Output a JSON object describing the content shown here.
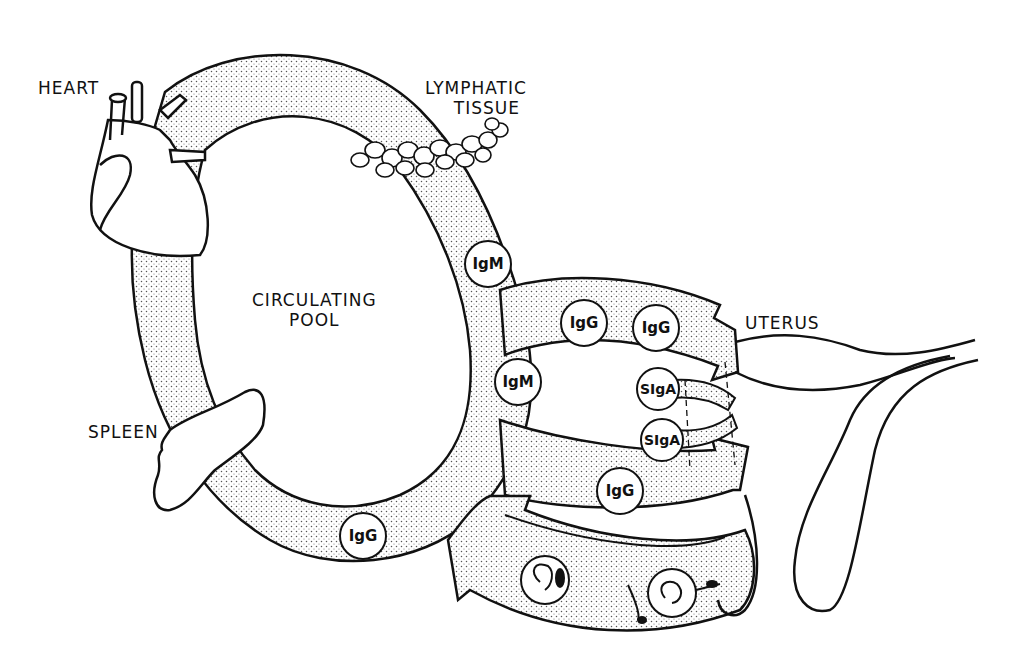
{
  "labels": {
    "heart": "HEART",
    "lymphatic_line1": "LYMPHATIC",
    "lymphatic_line2": "TISSUE",
    "circulating_line1": "CIRCULATING",
    "circulating_line2": "POOL",
    "spleen": "SPLEEN",
    "uterus": "UTERUS"
  },
  "antibodies": [
    {
      "label": "IgM",
      "location": "ring-right-upper"
    },
    {
      "label": "IgG",
      "location": "upper-arrow-left"
    },
    {
      "label": "IgG",
      "location": "upper-arrow-right"
    },
    {
      "label": "IgM",
      "location": "ring-right-middle"
    },
    {
      "label": "SIgA",
      "location": "secretory-upper"
    },
    {
      "label": "SIgA",
      "location": "secretory-lower"
    },
    {
      "label": "IgG",
      "location": "lower-arrow"
    },
    {
      "label": "IgG",
      "location": "ring-bottom"
    }
  ],
  "colors": {
    "ink": "#111111",
    "stipple": "#555555",
    "background": "#ffffff"
  }
}
